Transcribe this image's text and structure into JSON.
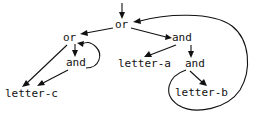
{
  "figure": {
    "kind": "directed-graph",
    "background_color": "#ffffff",
    "stroke_color": "#111111",
    "text_color": "#111111",
    "width": 255,
    "height": 114
  },
  "nodes": [
    {
      "id": "or-root",
      "label": "or",
      "x": 115,
      "y": 19
    },
    {
      "id": "or-left",
      "label": "or",
      "x": 63,
      "y": 32
    },
    {
      "id": "and-left",
      "label": "and",
      "x": 66,
      "y": 57
    },
    {
      "id": "letter-c",
      "label": "letter-c",
      "x": 5,
      "y": 88
    },
    {
      "id": "and-right",
      "label": "and",
      "x": 172,
      "y": 32
    },
    {
      "id": "letter-a",
      "label": "letter-a",
      "x": 118,
      "y": 58
    },
    {
      "id": "and-inner",
      "label": "and",
      "x": 185,
      "y": 58
    },
    {
      "id": "letter-b",
      "label": "letter-b",
      "x": 175,
      "y": 87
    }
  ],
  "edges": [
    {
      "id": "entry-to-or-root",
      "from": "",
      "to": "or-root",
      "style": "straight",
      "arrow": true
    },
    {
      "id": "or-root-to-or-left",
      "from": "or-root",
      "to": "or-left",
      "style": "straight",
      "arrow": true
    },
    {
      "id": "or-root-to-and-right",
      "from": "or-root",
      "to": "and-right",
      "style": "straight",
      "arrow": true
    },
    {
      "id": "or-left-to-and-left",
      "from": "or-left",
      "to": "and-left",
      "style": "straight",
      "arrow": true
    },
    {
      "id": "or-left-to-letter-c",
      "from": "or-left",
      "to": "letter-c",
      "style": "straight",
      "arrow": true
    },
    {
      "id": "and-left-to-letter-c",
      "from": "and-left",
      "to": "letter-c",
      "style": "straight",
      "arrow": true
    },
    {
      "id": "and-left-loop-to-or-left",
      "from": "and-left",
      "to": "or-left",
      "style": "curved",
      "arrow": true
    },
    {
      "id": "and-right-to-letter-a",
      "from": "and-right",
      "to": "letter-a",
      "style": "straight",
      "arrow": true
    },
    {
      "id": "and-right-to-and-inner",
      "from": "and-right",
      "to": "and-inner",
      "style": "straight",
      "arrow": true
    },
    {
      "id": "and-inner-to-letter-b",
      "from": "and-inner",
      "to": "letter-b",
      "style": "straight",
      "arrow": true
    },
    {
      "id": "and-inner-loop-to-or-root",
      "from": "and-inner",
      "to": "or-root",
      "style": "curved",
      "arrow": true
    }
  ],
  "legend": {
    "node_labels": [
      "or",
      "or",
      "and",
      "letter-c",
      "and",
      "letter-a",
      "and",
      "letter-b"
    ]
  }
}
